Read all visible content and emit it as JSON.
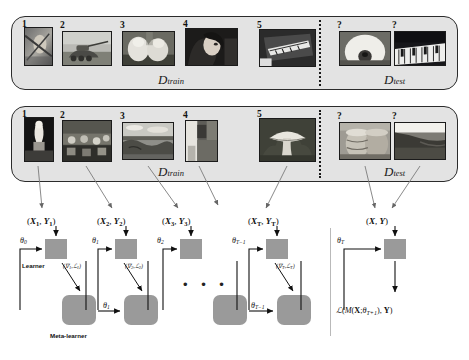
{
  "figure": {
    "episodes": [
      {
        "name": "episode-1",
        "train_label_main": "D",
        "train_label_sub": "train",
        "test_label_main": "D",
        "test_label_sub": "test",
        "train_items": [
          {
            "index": "1",
            "caption": "bird on branch"
          },
          {
            "index": "2",
            "caption": "military tank"
          },
          {
            "index": "3",
            "caption": "white dogs"
          },
          {
            "index": "4",
            "caption": "woman singing"
          },
          {
            "index": "5",
            "caption": "grand piano"
          }
        ],
        "test_items": [
          {
            "index": "?",
            "caption": "white dog"
          },
          {
            "index": "?",
            "caption": "piano keys"
          }
        ]
      },
      {
        "name": "episode-2",
        "train_label_main": "D",
        "train_label_sub": "train",
        "test_label_main": "D",
        "test_label_sub": "test",
        "train_items": [
          {
            "index": "1",
            "caption": "statue"
          },
          {
            "index": "2",
            "caption": "market crowd"
          },
          {
            "index": "3",
            "caption": "coastal landscape"
          },
          {
            "index": "4",
            "caption": "doorway"
          },
          {
            "index": "5",
            "caption": "mushroom"
          }
        ],
        "test_items": [
          {
            "index": "?",
            "caption": "stacked pots"
          },
          {
            "index": "?",
            "caption": "shoreline"
          }
        ]
      }
    ],
    "dataset_labels": [
      {
        "main": "D",
        "sub": "train"
      },
      {
        "main": "D",
        "sub": "test"
      }
    ],
    "batch_labels": [
      {
        "x": "X",
        "xsub": "1",
        "y": "Y",
        "ysub": "1"
      },
      {
        "x": "X",
        "xsub": "2",
        "y": "Y",
        "ysub": "2"
      },
      {
        "x": "X",
        "xsub": "3",
        "y": "Y",
        "ysub": "3"
      },
      {
        "x": "X",
        "xsub": "T",
        "y": "Y",
        "ysub": "T"
      },
      {
        "x": "X",
        "xsub": "",
        "y": "Y",
        "ysub": ""
      }
    ],
    "theta_top": [
      {
        "sym": "θ",
        "sub": "0"
      },
      {
        "sym": "θ",
        "sub": "1"
      },
      {
        "sym": "θ",
        "sub": "2"
      },
      {
        "sym": "θ",
        "sub": "T−1"
      },
      {
        "sym": "θ",
        "sub": "T"
      }
    ],
    "theta_bottom": [
      {
        "sym": "θ",
        "sub": "1"
      },
      {
        "sym": "θ",
        "sub": "T−1"
      }
    ],
    "grad_loss": [
      {
        "grad": "∇",
        "gsub": "1",
        "loss": "ℒ",
        "lsub": "1"
      },
      {
        "grad": "∇",
        "gsub": "2",
        "loss": "ℒ",
        "lsub": "2"
      },
      {
        "grad": "∇",
        "gsub": "T",
        "loss": "ℒ",
        "lsub": "T"
      }
    ],
    "learner_label": "Learner",
    "meta_learner_label": "Meta-learner",
    "ellipsis": "• • •",
    "final_loss": {
      "script_l": "ℒ",
      "open": "(",
      "model": "M",
      "x": "X",
      "semicolon": ";",
      "theta": "θ",
      "theta_sub": "T+1",
      "comma": ")",
      "y": "Y",
      "close": ")",
      "full": "ℒ(M(X; θT+1), Y)"
    },
    "colors": {
      "panel_fill": "#e3e3e3",
      "panel_border": "#2b2b2b",
      "box_fill": "#9a9a9a",
      "line": "#111111",
      "divider": "#1a1a1a"
    }
  }
}
